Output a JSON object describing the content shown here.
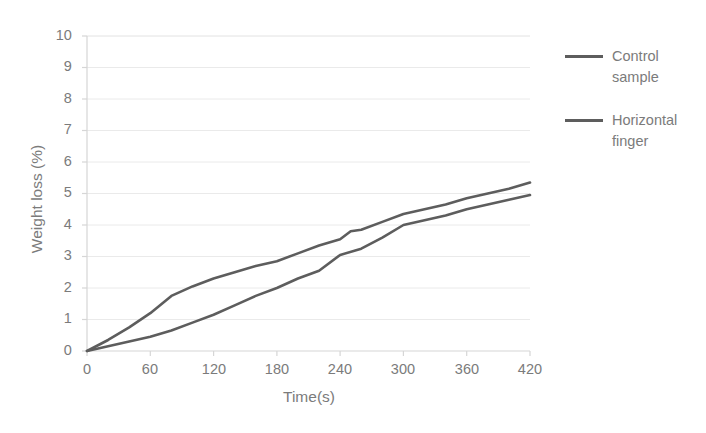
{
  "chart_data": {
    "type": "line",
    "title": "",
    "xlabel": "Time(s)",
    "ylabel": "Weight loss (%)",
    "xlim": [
      0,
      420
    ],
    "ylim": [
      0,
      10
    ],
    "x_ticks": [
      0,
      60,
      120,
      180,
      240,
      300,
      360,
      420
    ],
    "y_ticks": [
      0,
      1,
      2,
      3,
      4,
      5,
      6,
      7,
      8,
      9,
      10
    ],
    "grid": "horizontal",
    "legend_position": "right",
    "series": [
      {
        "name": "Control sample",
        "color": "#5d5d5d",
        "x": [
          0,
          20,
          40,
          60,
          80,
          100,
          120,
          140,
          160,
          180,
          200,
          220,
          240,
          260,
          280,
          300,
          320,
          340,
          360,
          380,
          400,
          420
        ],
        "values": [
          0,
          0.15,
          0.3,
          0.45,
          0.65,
          0.9,
          1.15,
          1.45,
          1.75,
          2.0,
          2.3,
          2.55,
          3.05,
          3.25,
          3.6,
          4.0,
          4.15,
          4.3,
          4.5,
          4.65,
          4.8,
          4.95
        ]
      },
      {
        "name": "Horizontal finger",
        "color": "#5d5d5d",
        "x": [
          0,
          20,
          40,
          60,
          80,
          100,
          120,
          140,
          160,
          180,
          200,
          220,
          240,
          250,
          260,
          280,
          300,
          320,
          340,
          360,
          380,
          400,
          420
        ],
        "values": [
          0,
          0.35,
          0.75,
          1.2,
          1.75,
          2.05,
          2.3,
          2.5,
          2.7,
          2.85,
          3.1,
          3.35,
          3.55,
          3.8,
          3.85,
          4.1,
          4.35,
          4.5,
          4.65,
          4.85,
          5.0,
          5.15,
          5.35
        ]
      }
    ]
  },
  "axes": {
    "y_title": "Weight loss (%)",
    "x_title": "Time(s)",
    "y_tick_labels": [
      "10",
      "9",
      "8",
      "7",
      "6",
      "5",
      "4",
      "3",
      "2",
      "1",
      "0"
    ],
    "x_tick_labels": [
      "0",
      "60",
      "120",
      "180",
      "240",
      "300",
      "360",
      "420"
    ]
  },
  "legend": {
    "entries": [
      {
        "label": "Control sample",
        "color": "#5d5d5d"
      },
      {
        "label": "Horizontal finger",
        "color": "#5d5d5d"
      }
    ]
  },
  "colors": {
    "series_line": "#5d5d5d",
    "gridline": "#e8e8e8",
    "axis": "#d6d6d6",
    "text": "#7b7b7b",
    "background": "#ffffff"
  }
}
